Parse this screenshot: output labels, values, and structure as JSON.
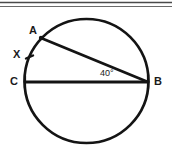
{
  "figure": {
    "background_color": "#ffffff",
    "stroke_color": "#141414",
    "label_color": "#1a1a1a",
    "width": 172,
    "height": 151
  },
  "header_rules": [
    {
      "name": "top-rule-1",
      "y": 2
    },
    {
      "name": "top-rule-2",
      "y": 6
    }
  ],
  "circle": {
    "center_x": 86.5,
    "center_y": 81,
    "radius": 62,
    "stroke_width": 2.6
  },
  "points": {
    "A": {
      "label": "A",
      "x": 41,
      "y": 38
    },
    "B": {
      "label": "B",
      "x": 148,
      "y": 82
    },
    "C": {
      "label": "C",
      "x": 25,
      "y": 82
    },
    "X": {
      "label": "X",
      "x": 29,
      "y": 57
    }
  },
  "chords": [
    {
      "name": "chord-AB",
      "from": "A",
      "to": "B"
    },
    {
      "name": "chord-CB",
      "from": "C",
      "to": "B"
    }
  ],
  "arc_tick": {
    "name": "arc-tick-X",
    "x": 29,
    "y": 57
  },
  "angle": {
    "label": "40°",
    "value": 40,
    "unit": "degrees",
    "vertex": "B",
    "between": [
      "BA",
      "BC"
    ]
  }
}
